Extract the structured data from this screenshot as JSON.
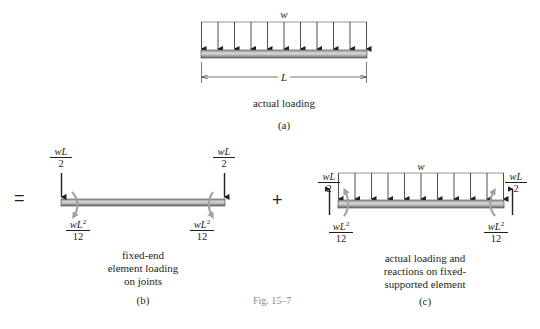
{
  "figure": {
    "caption": "Fig. 15–7",
    "colors": {
      "ink": "#231f20",
      "beam_dark": "#7d7d7d",
      "beam_light": "#d9d9d9",
      "moment_arrow": "#a0a0a0",
      "caption_gray": "#8a8a8a"
    }
  },
  "panel_a": {
    "load_label": "w",
    "dimension_label": "L",
    "description": "actual loading",
    "tag": "(a)",
    "arrow_count": 11
  },
  "operators": {
    "equals": "=",
    "plus": "+"
  },
  "panel_b": {
    "left_force": {
      "num": "wL",
      "den": "2"
    },
    "right_force": {
      "num": "wL",
      "den": "2"
    },
    "left_moment": {
      "num": "wL",
      "sup": "2",
      "den": "12"
    },
    "right_moment": {
      "num": "wL",
      "sup": "2",
      "den": "12"
    },
    "description_lines": [
      "fixed-end",
      "element loading",
      "on joints"
    ],
    "tag": "(b)"
  },
  "panel_c": {
    "load_label": "w",
    "left_force": {
      "num": "wL",
      "den": "2"
    },
    "right_force": {
      "num": "wL",
      "den": "2"
    },
    "left_moment": {
      "num": "wL",
      "sup": "2",
      "den": "12"
    },
    "right_moment": {
      "num": "wL",
      "sup": "2",
      "den": "12"
    },
    "description_lines": [
      "actual loading and",
      "reactions on fixed-",
      "supported element"
    ],
    "tag": "(c)",
    "arrow_count": 11
  }
}
